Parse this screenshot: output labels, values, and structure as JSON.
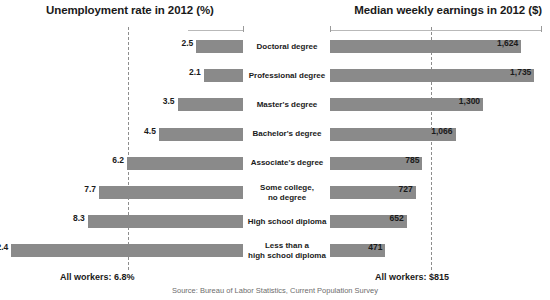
{
  "headers": {
    "left": "Unemployment rate in 2012 (%)",
    "right": "Median weekly earnings in 2012 ($)"
  },
  "footer": {
    "left_note": "All workers: 6.8%",
    "right_note": "All workers: $815",
    "source": "Source: Bureau of Labor Statistics, Current Population Survey"
  },
  "rows": [
    {
      "category": "Doctoral degree",
      "unemployment": "2.5",
      "earnings": "1,624"
    },
    {
      "category": "Professional degree",
      "unemployment": "2.1",
      "earnings": "1,735"
    },
    {
      "category": "Master's degree",
      "unemployment": "3.5",
      "earnings": "1,300"
    },
    {
      "category": "Bachelor's degree",
      "unemployment": "4.5",
      "earnings": "1,066"
    },
    {
      "category": "Associate's degree",
      "unemployment": "6.2",
      "earnings": "785"
    },
    {
      "category": "Some college,\nno degree",
      "unemployment": "7.7",
      "earnings": "727"
    },
    {
      "category": "High school diploma",
      "unemployment": "8.3",
      "earnings": "652"
    },
    {
      "category": "Less than a\nhigh school diploma",
      "unemployment": "12.4",
      "earnings": "471"
    }
  ],
  "chart_data": {
    "type": "bar",
    "orientation": "horizontal-bidirectional",
    "categories": [
      "Doctoral degree",
      "Professional degree",
      "Master's degree",
      "Bachelor's degree",
      "Associate's degree",
      "Some college, no degree",
      "High school diploma",
      "Less than a high school diploma"
    ],
    "series": [
      {
        "name": "Unemployment rate in 2012 (%)",
        "side": "left",
        "unit": "%",
        "values": [
          2.5,
          2.1,
          3.5,
          4.5,
          6.2,
          7.7,
          8.3,
          12.4
        ],
        "axis_max": 13.0,
        "reference_line": {
          "label": "All workers: 6.8%",
          "value": 6.8
        }
      },
      {
        "name": "Median weekly earnings in 2012 ($)",
        "side": "right",
        "unit": "$",
        "values": [
          1624,
          1735,
          1300,
          1066,
          785,
          727,
          652,
          471
        ],
        "axis_max": 1800,
        "reference_line": {
          "label": "All workers: $815",
          "value": 815
        }
      }
    ],
    "xlabel": "",
    "ylabel": "",
    "grid": false,
    "legend": "none",
    "bar_color": "#8a8a8a",
    "annotations": [
      "Source: Bureau of Labor Statistics, Current Population Survey"
    ]
  }
}
